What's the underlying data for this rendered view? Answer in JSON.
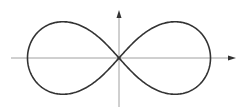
{
  "figure": {
    "type": "diagram",
    "curve": {
      "name": "lemniscate",
      "color": "#333333",
      "stroke_width": 1.6
    },
    "axes": {
      "color": "#a0a0a0",
      "arrow_color": "#333333",
      "origin_px": [
        119,
        58
      ],
      "x_axis": {
        "from_px": 11,
        "to_px": 236
      },
      "y_axis": {
        "from_px": 107,
        "to_px": 10
      }
    },
    "labels": []
  }
}
